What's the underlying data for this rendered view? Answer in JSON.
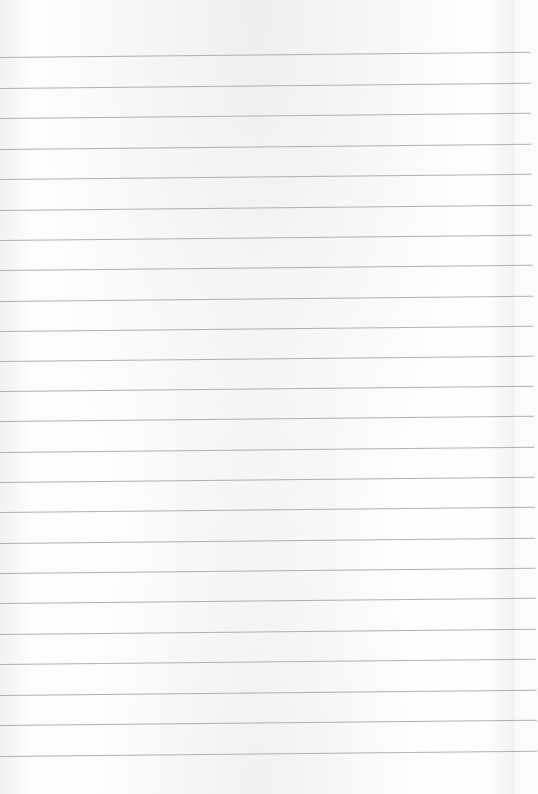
{
  "page": {
    "type": "blank lined paper",
    "background_color": "#fbfbfb",
    "line_color": "#a9a9a9",
    "line_count": 24,
    "line_positions_left_y": [
      57,
      88,
      118,
      149,
      179,
      210,
      240,
      270,
      301,
      331,
      361,
      391,
      421,
      452,
      482,
      512,
      543,
      573,
      603,
      634,
      664,
      695,
      725,
      756
    ]
  }
}
